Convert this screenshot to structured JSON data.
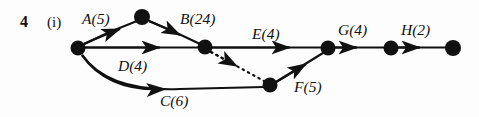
{
  "figure": {
    "question_number": "4",
    "part_label": "(i)",
    "type": "activity-network-diagram",
    "ink_color": "#111111",
    "background_color": "#fdfdfd",
    "width": 479,
    "height": 117
  },
  "nodes": [
    {
      "id": "n-start",
      "name": "start-node",
      "x": 78,
      "y": 48,
      "r": 7.5
    },
    {
      "id": "n-top",
      "name": "top-node",
      "x": 142,
      "y": 17,
      "r": 8.0
    },
    {
      "id": "n-mid",
      "name": "middle-node",
      "x": 205,
      "y": 47,
      "r": 7.5
    },
    {
      "id": "n-low",
      "name": "lower-node",
      "x": 270,
      "y": 85,
      "r": 7.5
    },
    {
      "id": "n-merge",
      "name": "merge-node",
      "x": 328,
      "y": 48,
      "r": 7.5
    },
    {
      "id": "n-pre",
      "name": "penultimate-node",
      "x": 391,
      "y": 48,
      "r": 7.5
    },
    {
      "id": "n-end",
      "name": "end-node",
      "x": 453,
      "y": 48,
      "r": 8.0
    }
  ],
  "edges": [
    {
      "id": "edge-A",
      "name": "edge-a",
      "label": "A(5)",
      "activity": "A",
      "duration": 5,
      "from": "n-start",
      "to": "n-top",
      "style": "solid",
      "shape": "curve"
    },
    {
      "id": "edge-B",
      "name": "edge-b",
      "label": "B(24)",
      "activity": "B",
      "duration": 24,
      "from": "n-top",
      "to": "n-mid",
      "style": "solid",
      "shape": "curve"
    },
    {
      "id": "edge-D",
      "name": "edge-d",
      "label": "D(4)",
      "activity": "D",
      "duration": 4,
      "from": "n-start",
      "to": "n-mid",
      "style": "solid",
      "shape": "straight"
    },
    {
      "id": "edge-C",
      "name": "edge-c",
      "label": "C(6)",
      "activity": "C",
      "duration": 6,
      "from": "n-start",
      "to": "n-low",
      "style": "solid",
      "shape": "curve"
    },
    {
      "id": "edge-dummy",
      "name": "edge-dummy",
      "label": "",
      "activity": "",
      "duration": null,
      "from": "n-mid",
      "to": "n-low",
      "style": "dotted",
      "shape": "straight"
    },
    {
      "id": "edge-E",
      "name": "edge-e",
      "label": "E(4)",
      "activity": "E",
      "duration": 4,
      "from": "n-mid",
      "to": "n-merge",
      "style": "solid",
      "shape": "straight"
    },
    {
      "id": "edge-F",
      "name": "edge-f",
      "label": "F(5)",
      "activity": "F",
      "duration": 5,
      "from": "n-low",
      "to": "n-merge",
      "style": "solid",
      "shape": "straight"
    },
    {
      "id": "edge-G",
      "name": "edge-g",
      "label": "G(4)",
      "activity": "G",
      "duration": 4,
      "from": "n-merge",
      "to": "n-pre",
      "style": "solid",
      "shape": "straight"
    },
    {
      "id": "edge-H",
      "name": "edge-h",
      "label": "H(2)",
      "activity": "H",
      "duration": 2,
      "from": "n-pre",
      "to": "n-end",
      "style": "solid",
      "shape": "straight"
    }
  ],
  "labels": {
    "question_number": "4",
    "part": "(i)",
    "A": "A(5)",
    "B": "B(24)",
    "C": "C(6)",
    "D": "D(4)",
    "E": "E(4)",
    "F": "F(5)",
    "G": "G(4)",
    "H": "H(2)"
  }
}
